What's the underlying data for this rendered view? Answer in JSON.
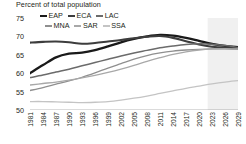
{
  "chart_data": {
    "type": "line",
    "title": "Percent of total population",
    "xlabel": "",
    "ylabel": "",
    "ylim": [
      50,
      75
    ],
    "xlim": [
      1981,
      2030
    ],
    "yticks": [
      75,
      70,
      65,
      60,
      55,
      50
    ],
    "grid": false,
    "legend_position": "top-left",
    "forecast_start": 2022,
    "forecast_shaded": true,
    "x": [
      1981,
      1984,
      1987,
      1990,
      1993,
      1996,
      1999,
      2002,
      2005,
      2008,
      2011,
      2014,
      2017,
      2020,
      2023,
      2026,
      2029
    ],
    "xtick_labels": [
      "1981",
      "1984",
      "1987",
      "1990",
      "1993",
      "1996",
      "1999",
      "2002",
      "2005",
      "2008",
      "2011",
      "2014",
      "2017",
      "2020",
      "2023",
      "2026",
      "2029"
    ],
    "series": [
      {
        "name": "EAP",
        "color": "#1a1a1a",
        "values": [
          60.0,
          62.2,
          64.3,
          65.3,
          65.6,
          66.3,
          67.3,
          68.4,
          69.3,
          70.0,
          70.4,
          70.2,
          69.6,
          68.8,
          68.0,
          67.4,
          67.1
        ]
      },
      {
        "name": "ECA",
        "color": "#3d3d3d",
        "values": [
          68.3,
          68.5,
          68.6,
          68.4,
          68.0,
          68.2,
          68.6,
          69.0,
          69.5,
          69.9,
          70.1,
          69.6,
          68.7,
          67.8,
          67.2,
          66.9,
          66.8
        ]
      },
      {
        "name": "LAC",
        "color": "#6b6b6b",
        "values": [
          58.8,
          59.5,
          60.3,
          61.1,
          62.0,
          62.9,
          63.8,
          64.7,
          65.5,
          66.2,
          66.9,
          67.4,
          67.8,
          68.0,
          67.9,
          67.5,
          67.0
        ]
      },
      {
        "name": "MNA",
        "color": "#8f8f8f",
        "values": [
          55.3,
          56.1,
          57.0,
          57.9,
          58.9,
          60.1,
          61.4,
          62.6,
          63.8,
          64.8,
          65.5,
          66.0,
          66.3,
          66.5,
          66.6,
          66.6,
          66.5
        ]
      },
      {
        "name": "SAR",
        "color": "#a8a8a8",
        "values": [
          56.8,
          57.2,
          57.6,
          58.1,
          58.7,
          59.4,
          60.2,
          61.1,
          62.1,
          63.2,
          64.2,
          65.1,
          65.8,
          66.3,
          66.6,
          66.7,
          66.6
        ]
      },
      {
        "name": "SSA",
        "color": "#c4c4c4",
        "values": [
          52.3,
          52.3,
          52.2,
          52.1,
          52.0,
          52.1,
          52.3,
          52.7,
          53.2,
          53.8,
          54.5,
          55.2,
          55.9,
          56.5,
          57.1,
          57.6,
          58.0
        ]
      }
    ]
  }
}
